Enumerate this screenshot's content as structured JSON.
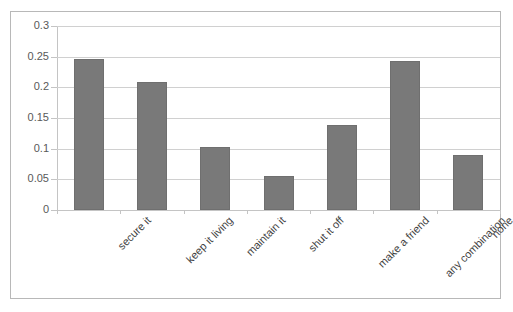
{
  "chart_data": {
    "type": "bar",
    "title": "",
    "title_fragment": "",
    "xlabel": "",
    "ylabel": "",
    "ylim": [
      0,
      0.3
    ],
    "yticks": [
      "0",
      "0.05",
      "0.1",
      "0.15",
      "0.2",
      "0.25",
      "0.3"
    ],
    "ytick_values": [
      0,
      0.05,
      0.1,
      0.15,
      0.2,
      0.25,
      0.3
    ],
    "grid": true,
    "legend": false,
    "legend_position": "none",
    "categories": [
      "secure it",
      "keep it living",
      "maintain it",
      "shut it off",
      "make a friend",
      "any combination",
      "none"
    ],
    "values": [
      0.246,
      0.209,
      0.102,
      0.056,
      0.139,
      0.243,
      0.089
    ],
    "bar_color": "#797979",
    "bar_border_color": "#6f6f6f",
    "gridline_color": "#d0d0d0",
    "axis_color": "#c4c4c4",
    "frame_border_color": "#b8b8b8",
    "tick_label_color": "#595959",
    "category_label_color": "#3f3f3f",
    "label_rotation_deg": -45
  }
}
